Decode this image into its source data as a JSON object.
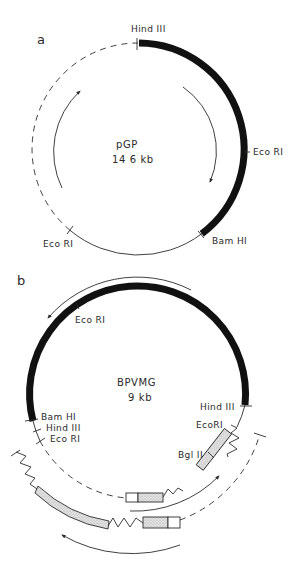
{
  "figure": {
    "panel_a": {
      "label": "a",
      "plasmid_name": "pGP",
      "plasmid_size": "14 6 kb",
      "sites": {
        "top": "Hind III",
        "right": "Eco RI",
        "lower_right": "Bam HI",
        "lower_left": "Eco RI"
      },
      "segments": [
        "thick insert Hind III → Bam HI (clockwise)",
        "thin solid Bam HI → Eco RI",
        "dashed Eco RI → Hind III"
      ],
      "arrows": [
        "inner-left arc pointing up (counter-clockwise)",
        "inner-right arc pointing down (clockwise)"
      ]
    },
    "panel_b": {
      "label": "b",
      "plasmid_name": "BPVMG",
      "plasmid_size": "9 kb",
      "sites": {
        "upper_left": "Eco RI",
        "left_1": "Bam HI",
        "left_2": "Hind III",
        "left_3": "Eco RI",
        "right_1": "Hind III",
        "right_2": "EcoRI",
        "insert": "Bgl II"
      },
      "arrows": [
        "outer top arc pointing left",
        "inner-bottom arc pointing up-right",
        "outer-bottom arc pointing left"
      ]
    }
  },
  "colors": {
    "ink": "#2a2a2a",
    "thick": "#111111",
    "background": "#ffffff",
    "stipple": "#bdbdbd"
  }
}
